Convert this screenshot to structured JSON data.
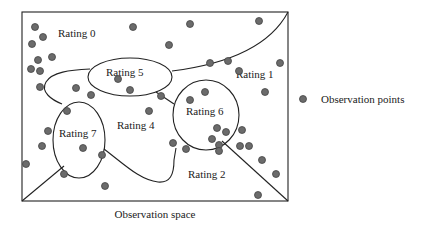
{
  "diagram": {
    "caption": "Observation space",
    "legend": {
      "label": "Observation points",
      "marker_color": "#6b6b6b"
    },
    "regions": [
      {
        "name": "rating-0",
        "label": "Rating 0",
        "x": 58,
        "y": 37
      },
      {
        "name": "rating-5",
        "label": "Rating 5",
        "x": 106,
        "y": 76
      },
      {
        "name": "rating-1",
        "label": "Rating 1",
        "x": 236,
        "y": 78
      },
      {
        "name": "rating-7",
        "label": "Rating 7",
        "x": 59,
        "y": 137
      },
      {
        "name": "rating-4",
        "label": "Rating 4",
        "x": 117,
        "y": 129
      },
      {
        "name": "rating-6",
        "label": "Rating 6",
        "x": 186,
        "y": 115
      },
      {
        "name": "rating-2",
        "label": "Rating 2",
        "x": 188,
        "y": 178
      }
    ],
    "points": [
      [
        35,
        27
      ],
      [
        43,
        37
      ],
      [
        32,
        44
      ],
      [
        38,
        60
      ],
      [
        52,
        57
      ],
      [
        31,
        69
      ],
      [
        40,
        71
      ],
      [
        40,
        87
      ],
      [
        76,
        88
      ],
      [
        91,
        95
      ],
      [
        133,
        27
      ],
      [
        169,
        45
      ],
      [
        190,
        24
      ],
      [
        259,
        21
      ],
      [
        210,
        63
      ],
      [
        228,
        61
      ],
      [
        239,
        71
      ],
      [
        280,
        63
      ],
      [
        265,
        92
      ],
      [
        118,
        79
      ],
      [
        130,
        90
      ],
      [
        161,
        96
      ],
      [
        149,
        111
      ],
      [
        190,
        100
      ],
      [
        205,
        92
      ],
      [
        67,
        111
      ],
      [
        48,
        131
      ],
      [
        42,
        146
      ],
      [
        26,
        164
      ],
      [
        83,
        148
      ],
      [
        102,
        155
      ],
      [
        64,
        174
      ],
      [
        105,
        186
      ],
      [
        173,
        143
      ],
      [
        186,
        149
      ],
      [
        217,
        128
      ],
      [
        226,
        132
      ],
      [
        242,
        130
      ],
      [
        212,
        139
      ],
      [
        219,
        145
      ],
      [
        219,
        151
      ],
      [
        240,
        146
      ],
      [
        249,
        146
      ],
      [
        262,
        160
      ],
      [
        276,
        174
      ],
      [
        258,
        195
      ]
    ]
  }
}
